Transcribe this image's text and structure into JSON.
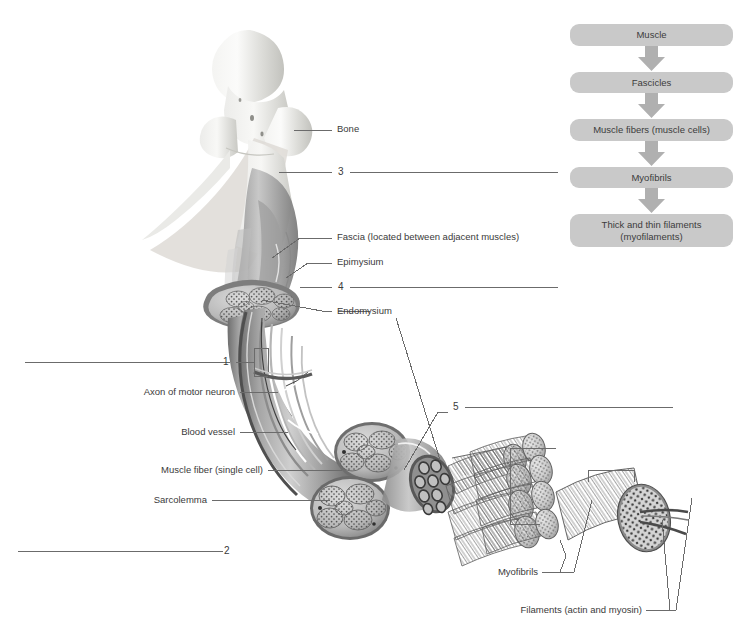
{
  "page": {
    "background": "#ffffff",
    "text_color": "#3a3a3a",
    "line_color": "#6b6b6b"
  },
  "flowchart": {
    "name": "muscle-organization-flowchart",
    "box_color": "#c9c9c9",
    "arrow_color": "#b0b0b0",
    "steps": [
      {
        "label": "Muscle"
      },
      {
        "label": "Fascicles"
      },
      {
        "label": "Muscle fibers (muscle cells)"
      },
      {
        "label": "Myofibrils"
      },
      {
        "label": "Thick and thin filaments\n(myofilaments)",
        "line1": "Thick and thin filaments",
        "line2": "(myofilaments)"
      }
    ],
    "arrow_icon": "down-arrow-icon"
  },
  "labels": {
    "bone": "Bone",
    "fascia": "Fascia (located between adjacent muscles)",
    "epimysium": "Epimysium",
    "endomysium": "Endomysium",
    "axon": "Axon of motor neuron",
    "blood_vessel": "Blood vessel",
    "muscle_fiber": "Muscle fiber (single cell)",
    "sarcolemma": "Sarcolemma",
    "myofibrils": "Myofibrils",
    "filaments": "Filaments (actin and myosin)"
  },
  "numbered_blanks": [
    {
      "number": "1"
    },
    {
      "number": "2"
    },
    {
      "number": "3"
    },
    {
      "number": "4"
    },
    {
      "number": "5"
    }
  ],
  "illustration": {
    "name": "skeletal-muscle-cutaway-illustration",
    "parts": [
      "femur-bone-head",
      "muscle-belly",
      "tendon-fascicle-cross-section",
      "fascicle-bundle",
      "myofibril-bundle",
      "filament-cross-section"
    ]
  }
}
